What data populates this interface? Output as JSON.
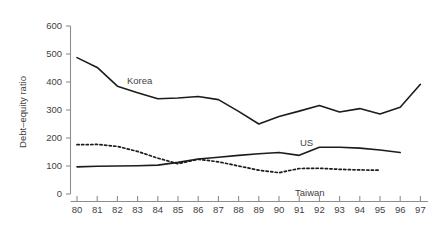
{
  "chart_data": {
    "type": "line",
    "title": "",
    "xlabel": "",
    "ylabel": "Debt–equity ratio",
    "xlim": [
      80,
      97
    ],
    "ylim": [
      0,
      600
    ],
    "grid": false,
    "legend_position": "inline-annotations",
    "x": [
      80,
      81,
      82,
      83,
      84,
      85,
      86,
      87,
      88,
      89,
      90,
      91,
      92,
      93,
      94,
      95,
      96,
      97
    ],
    "xtick_labels": [
      "80",
      "81",
      "82",
      "83",
      "84",
      "85",
      "86",
      "87",
      "88",
      "89",
      "90",
      "91",
      "92",
      "93",
      "94",
      "95",
      "96",
      "97"
    ],
    "ytick_labels": [
      "0",
      "100",
      "200",
      "300",
      "400",
      "500",
      "600"
    ],
    "yticks": [
      0,
      100,
      200,
      300,
      400,
      500,
      600
    ],
    "series": [
      {
        "name": "Korea",
        "style": "solid",
        "color": "#1c1c1c",
        "x": [
          80,
          81,
          82,
          83,
          84,
          85,
          86,
          87,
          88,
          89,
          90,
          91,
          92,
          93,
          94,
          95,
          96,
          97
        ],
        "values": [
          487,
          452,
          385,
          362,
          340,
          343,
          348,
          337,
          295,
          250,
          277,
          296,
          316,
          293,
          305,
          286,
          310,
          392
        ]
      },
      {
        "name": "US",
        "style": "solid",
        "color": "#1c1c1c",
        "x": [
          80,
          81,
          82,
          83,
          84,
          85,
          86,
          87,
          88,
          89,
          90,
          91,
          92,
          93,
          94,
          95,
          96
        ],
        "values": [
          97,
          99,
          100,
          101,
          103,
          113,
          125,
          131,
          138,
          144,
          148,
          138,
          167,
          167,
          164,
          157,
          148
        ]
      },
      {
        "name": "Taiwan",
        "style": "dotted",
        "color": "#1c1c1c",
        "x": [
          80,
          81,
          82,
          83,
          84,
          85,
          86,
          87,
          88,
          89,
          90,
          91,
          92,
          93,
          94,
          95
        ],
        "values": [
          176,
          177,
          170,
          152,
          128,
          108,
          124,
          115,
          100,
          85,
          76,
          91,
          92,
          88,
          86,
          85
        ]
      }
    ],
    "annotations": [
      {
        "text": "Korea",
        "x_px": 127,
        "y_px": 84
      },
      {
        "text": "US",
        "x_px": 300,
        "y_px": 146
      },
      {
        "text": "Taiwan",
        "x_px": 295,
        "y_px": 196
      }
    ]
  },
  "axis": {
    "y_title": "Debt–equity ratio",
    "y_ticks": [
      "600",
      "500",
      "400",
      "300",
      "200",
      "100",
      "0"
    ],
    "x_ticks": [
      "80",
      "81",
      "82",
      "83",
      "84",
      "85",
      "86",
      "87",
      "88",
      "89",
      "90",
      "91",
      "92",
      "93",
      "94",
      "95",
      "96",
      "97"
    ]
  },
  "labels": {
    "korea": "Korea",
    "us": "US",
    "taiwan": "Taiwan"
  },
  "colors": {
    "background": "#ffffff",
    "line": "#1c1c1c",
    "axis": "#8d8d8d",
    "text": "#3f3f3f"
  }
}
